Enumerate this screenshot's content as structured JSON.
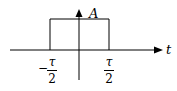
{
  "diagram": {
    "type": "rectangular-pulse",
    "amplitude_label": "A",
    "time_axis_label": "t",
    "left_edge": {
      "sign": "−",
      "numerator": "τ",
      "denominator": "2"
    },
    "right_edge": {
      "numerator": "τ",
      "denominator": "2"
    },
    "stroke_color": "#000000",
    "background": "#ffffff"
  }
}
